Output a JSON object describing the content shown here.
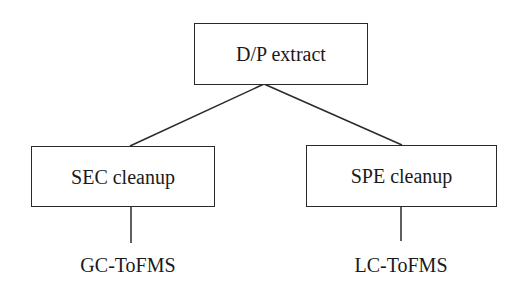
{
  "diagram": {
    "type": "tree-flowchart",
    "nodes": {
      "root": {
        "label": "D/P extract"
      },
      "left": {
        "label": "SEC cleanup"
      },
      "right": {
        "label": "SPE cleanup"
      }
    },
    "leaves": {
      "left": {
        "label": "GC-ToFMS"
      },
      "right": {
        "label": "LC-ToFMS"
      }
    },
    "edges": [
      {
        "from": "D/P extract",
        "to": "SEC cleanup"
      },
      {
        "from": "D/P extract",
        "to": "SPE cleanup"
      },
      {
        "from": "SEC cleanup",
        "to": "GC-ToFMS"
      },
      {
        "from": "SPE cleanup",
        "to": "LC-ToFMS"
      }
    ],
    "colors": {
      "stroke": "#2a2a2a",
      "text": "#1a1a1a",
      "background": "#ffffff"
    }
  }
}
